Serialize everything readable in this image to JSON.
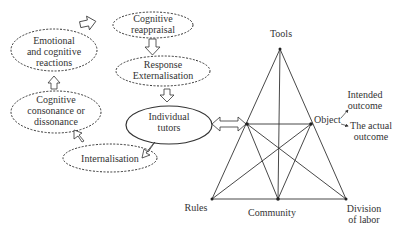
{
  "cycle": {
    "nodes": [
      {
        "id": "cognitive-reappraisal",
        "lines": [
          "Cognitive",
          "reappraisal"
        ]
      },
      {
        "id": "response-externalisation",
        "lines": [
          "Response",
          "Externalisation"
        ]
      },
      {
        "id": "individual-tutors",
        "lines": [
          "Individual",
          "tutors"
        ]
      },
      {
        "id": "internalisation",
        "lines": [
          "Internalisation"
        ]
      },
      {
        "id": "cognitive-consonance",
        "lines": [
          "Cognitive",
          "consonance or",
          "dissonance"
        ]
      },
      {
        "id": "emotional-reactions",
        "lines": [
          "Emotional",
          "and cognitive",
          "reactions"
        ]
      }
    ]
  },
  "triangle": {
    "tools": "Tools",
    "object": "Object",
    "rules": "Rules",
    "community": "Community",
    "division": [
      "Division",
      "of labor"
    ]
  },
  "outcomes": {
    "intended": [
      "Intended",
      "outcome"
    ],
    "actual": [
      "The actual",
      "outcome"
    ]
  },
  "colors": {
    "stroke": "#333333",
    "background": "#ffffff"
  }
}
